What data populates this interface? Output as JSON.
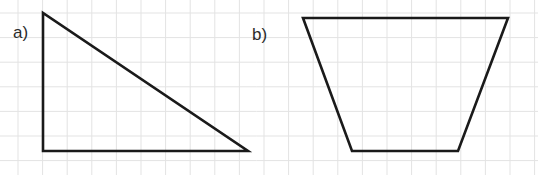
{
  "figure": {
    "background_color": "#ffffff",
    "grid": {
      "line_color": "#e3e3e3",
      "cell_size_px": 24.6,
      "origin_x_px": 18,
      "origin_y_px": 13,
      "columns": 21,
      "rows": 7,
      "visible": true
    },
    "stroke_color": "#1a1a1a",
    "stroke_width_px": 2.6,
    "label_color": "#2b2b2b"
  },
  "shapes": [
    {
      "label": "a)",
      "name": "right-triangle",
      "label_x": 13,
      "label_y": 38,
      "points": "43,13 43,151 248,151",
      "vertices": [
        {
          "x": 43,
          "y": 13
        },
        {
          "x": 43,
          "y": 151
        },
        {
          "x": 248,
          "y": 151
        }
      ],
      "grid_vertices": [
        {
          "col": 1,
          "row": 0
        },
        {
          "col": 1,
          "row": 5.6
        },
        {
          "col": 9.3,
          "row": 5.6
        }
      ]
    },
    {
      "label": "b)",
      "name": "isosceles-trapezoid",
      "label_x": 252,
      "label_y": 40,
      "points": "303,18 508,18 458,151 352,151",
      "vertices": [
        {
          "x": 303,
          "y": 18
        },
        {
          "x": 508,
          "y": 18
        },
        {
          "x": 458,
          "y": 151
        },
        {
          "x": 352,
          "y": 151
        }
      ],
      "grid_vertices": [
        {
          "col": 11.6,
          "row": 0.2
        },
        {
          "col": 19.9,
          "row": 0.2
        },
        {
          "col": 17.9,
          "row": 5.6
        },
        {
          "col": 13.6,
          "row": 5.6
        }
      ]
    }
  ]
}
